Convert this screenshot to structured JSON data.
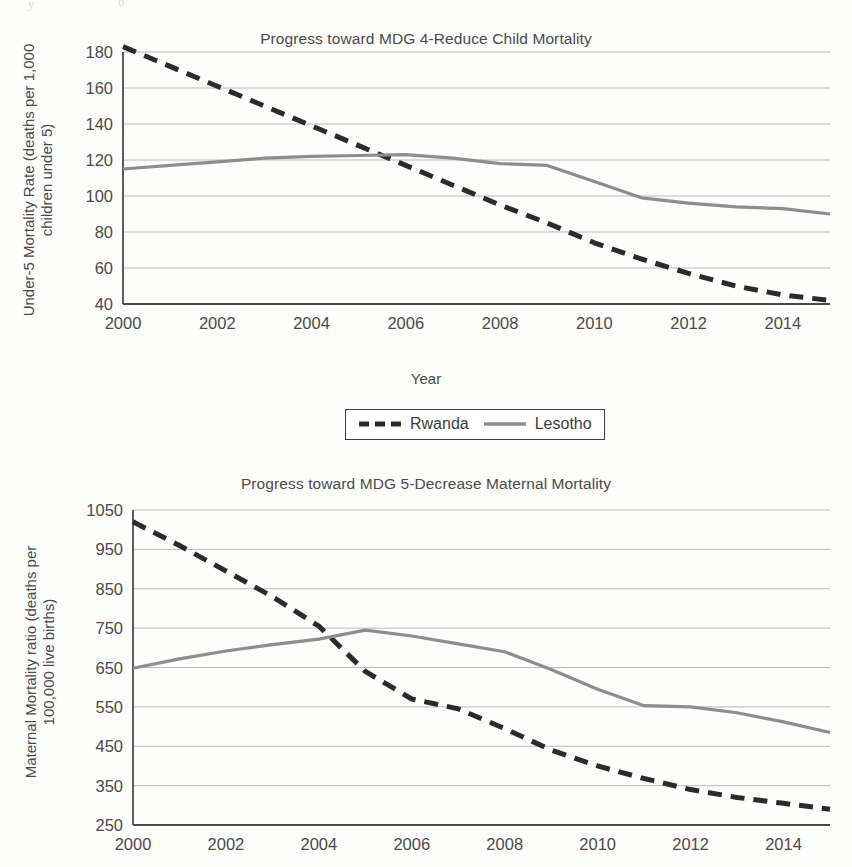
{
  "page": {
    "background_color": "#fdfdfc",
    "artifacts": [
      "y",
      "o"
    ]
  },
  "series_style": {
    "rwanda": {
      "color": "#2b2b2b",
      "dash": "14 9",
      "width": 5,
      "style": "dashed"
    },
    "lesotho": {
      "color": "#8d8d8d",
      "dash": "none",
      "width": 3.2,
      "style": "solid"
    }
  },
  "legend": {
    "position": "below-chart-1",
    "entries": [
      {
        "label": "Rwanda",
        "style": "dashed",
        "color": "#2b2b2b"
      },
      {
        "label": "Lesotho",
        "style": "solid",
        "color": "#8d8d8d"
      }
    ]
  },
  "figures": {
    "child": {
      "title": "Progress toward MDG 4-Reduce Child Mortality",
      "ylabel_line1": "Under-5 Mortality Rate (deaths per 1,000",
      "ylabel_line2": "children under 5)",
      "xlabel": "Year"
    },
    "maternal": {
      "title": "Progress toward MDG 5-Decrease Maternal Mortality",
      "ylabel_line1": "Maternal Mortality ratio (deaths per",
      "ylabel_line2": "100,000 live births)",
      "xlabel": ""
    }
  },
  "chart_data": [
    {
      "id": "child-mortality",
      "type": "line",
      "title": "Progress toward MDG 4-Reduce Child Mortality",
      "xlabel": "Year",
      "ylabel": "Under-5 Mortality Rate (deaths per 1,000 children under 5)",
      "x": [
        2000,
        2001,
        2002,
        2003,
        2004,
        2005,
        2006,
        2007,
        2008,
        2009,
        2010,
        2011,
        2012,
        2013,
        2014,
        2015
      ],
      "xlim": [
        2000,
        2015
      ],
      "ylim": [
        40,
        180
      ],
      "xticks": [
        2000,
        2002,
        2004,
        2006,
        2008,
        2010,
        2012,
        2014
      ],
      "yticks": [
        40,
        60,
        80,
        100,
        120,
        140,
        160,
        180
      ],
      "grid": "horizontal",
      "legend_position": "bottom-center-outside",
      "series": [
        {
          "name": "Rwanda",
          "style": "dashed",
          "color": "#2b2b2b",
          "values": [
            183,
            172,
            161,
            150,
            139,
            128,
            117,
            106,
            95,
            85,
            74,
            65,
            57,
            50,
            45,
            42
          ]
        },
        {
          "name": "Lesotho",
          "style": "solid",
          "color": "#8d8d8d",
          "values": [
            115,
            117,
            119,
            121,
            122,
            122.5,
            123,
            121,
            118,
            117,
            108,
            99,
            96,
            94,
            93,
            90
          ]
        }
      ]
    },
    {
      "id": "maternal-mortality",
      "type": "line",
      "title": "Progress toward MDG 5-Decrease Maternal Mortality",
      "xlabel": "",
      "ylabel": "Maternal Mortality ratio (deaths per 100,000 live births)",
      "x": [
        2000,
        2001,
        2002,
        2003,
        2004,
        2005,
        2006,
        2007,
        2008,
        2009,
        2010,
        2011,
        2012,
        2013,
        2014,
        2015
      ],
      "xlim": [
        2000,
        2015
      ],
      "ylim": [
        250,
        1050
      ],
      "xticks": [
        2000,
        2002,
        2004,
        2006,
        2008,
        2010,
        2012,
        2014
      ],
      "yticks": [
        250,
        350,
        450,
        550,
        650,
        750,
        850,
        950,
        1050
      ],
      "grid": "horizontal",
      "legend_position": "none",
      "series": [
        {
          "name": "Rwanda",
          "style": "dashed",
          "color": "#2b2b2b",
          "values": [
            1020,
            960,
            895,
            830,
            755,
            640,
            570,
            545,
            495,
            440,
            400,
            368,
            340,
            320,
            305,
            290
          ]
        },
        {
          "name": "Lesotho",
          "style": "solid",
          "color": "#8d8d8d",
          "values": [
            648,
            672,
            692,
            708,
            722,
            745,
            730,
            710,
            690,
            645,
            595,
            553,
            550,
            535,
            512,
            485
          ]
        }
      ]
    }
  ]
}
